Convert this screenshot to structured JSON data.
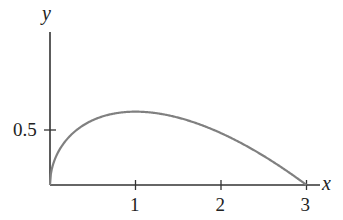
{
  "chart_data": {
    "type": "line",
    "title": "",
    "xlabel": "x",
    "ylabel": "y",
    "x_ticks": [
      1,
      2,
      3
    ],
    "x_tick_labels": [
      "1",
      "2",
      "3"
    ],
    "y_ticks": [
      0.5
    ],
    "y_tick_labels": [
      "0.5"
    ],
    "xlim": [
      0,
      3.2
    ],
    "ylim": [
      0,
      1.4
    ],
    "grid": false,
    "legend": null,
    "series": [
      {
        "name": "y = sqrt(x)(3 - x)/3",
        "color": "#808080",
        "x": [
          0,
          0.05,
          0.1,
          0.2,
          0.3,
          0.5,
          0.75,
          1.0,
          1.25,
          1.5,
          1.75,
          2.0,
          2.25,
          2.5,
          2.75,
          3.0
        ],
        "y": [
          0,
          0.219,
          0.306,
          0.418,
          0.493,
          0.589,
          0.65,
          0.667,
          0.652,
          0.612,
          0.551,
          0.471,
          0.375,
          0.264,
          0.138,
          0
        ]
      }
    ]
  },
  "axes": {
    "x_label": "x",
    "y_label": "y",
    "x_tick_1": "1",
    "x_tick_2": "2",
    "x_tick_3": "3",
    "y_tick_05": "0.5"
  },
  "colors": {
    "axis": "#333333",
    "curve": "#808080"
  }
}
